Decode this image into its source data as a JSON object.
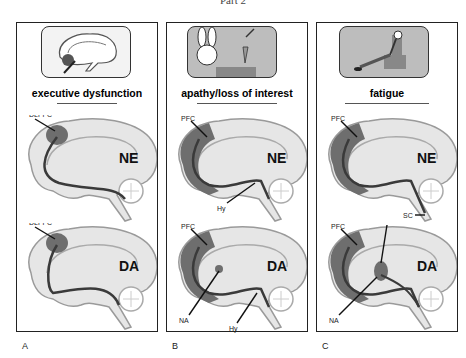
{
  "figure_title": "Part 2",
  "panels": [
    {
      "letter": "A",
      "heading": "executive dysfunction",
      "picture": "brain-sagittal-highlight",
      "top_brain": {
        "neurotransmitter": "NE",
        "labels": [
          "DLPFC"
        ]
      },
      "bottom_brain": {
        "neurotransmitter": "DA",
        "labels": [
          "DLPFC"
        ]
      }
    },
    {
      "letter": "B",
      "heading": "apathy/loss of interest",
      "picture": "bored-rabbit-with-carrot",
      "top_brain": {
        "neurotransmitter": "NE",
        "labels": [
          "PFC",
          "Hy"
        ]
      },
      "bottom_brain": {
        "neurotransmitter": "DA",
        "labels": [
          "PFC",
          "NA",
          "Hy"
        ]
      }
    },
    {
      "letter": "C",
      "heading": "fatigue",
      "picture": "tired-person-in-armchair",
      "top_brain": {
        "neurotransmitter": "NE",
        "labels": [
          "PFC",
          "SC"
        ]
      },
      "bottom_brain": {
        "neurotransmitter": "DA",
        "labels": [
          "PFC",
          "S",
          "NA"
        ]
      }
    }
  ],
  "colors": {
    "region": "#6e6e6e",
    "pathway": "#3a3a3a",
    "brain_fill": "#e6e6e6",
    "brain_outline": "#9a9a9a",
    "picture_bg": "#bdbdbd"
  }
}
